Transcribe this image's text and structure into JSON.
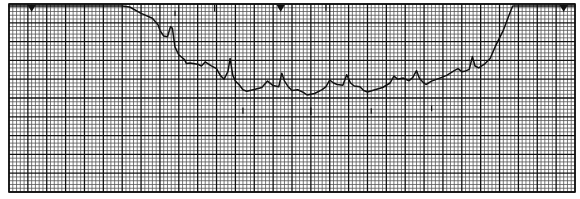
{
  "chart_data": {
    "type": "line",
    "title": "",
    "xlabel": "",
    "ylabel": "",
    "grid": true,
    "grid_major_every": 5,
    "x_range": [
      0,
      150
    ],
    "y_range": [
      0,
      50
    ],
    "colors": {
      "paper": "#ffffff",
      "grid_minor": "#555555",
      "grid_major": "#111111",
      "trace": "#111111"
    },
    "markers": [
      {
        "name": "start-marker",
        "x": 6
      },
      {
        "name": "center-marker",
        "x": 72
      },
      {
        "name": "end-marker",
        "x": 147
      }
    ],
    "series": [
      {
        "name": "trace",
        "points": [
          [
            0,
            49.5
          ],
          [
            30,
            49.5
          ],
          [
            32,
            49.2
          ],
          [
            35,
            47.5
          ],
          [
            38,
            46.2
          ],
          [
            39.5,
            44.5
          ],
          [
            40,
            43.0
          ],
          [
            41,
            41.5
          ],
          [
            42,
            41.3
          ],
          [
            42.8,
            44.0
          ],
          [
            43.3,
            43.5
          ],
          [
            44,
            38.5
          ],
          [
            45,
            36.5
          ],
          [
            46.5,
            35.2
          ],
          [
            47,
            34.2
          ],
          [
            48,
            34.3
          ],
          [
            50,
            34.0
          ],
          [
            51,
            33.5
          ],
          [
            52,
            34.6
          ],
          [
            53.5,
            33.6
          ],
          [
            55,
            32.8
          ],
          [
            56,
            31.0
          ],
          [
            57,
            30.0
          ],
          [
            58,
            32.0
          ],
          [
            58.6,
            35.5
          ],
          [
            59.3,
            31.0
          ],
          [
            60,
            29.5
          ],
          [
            61,
            28.5
          ],
          [
            62,
            27.2
          ],
          [
            63,
            26.8
          ],
          [
            65,
            27.3
          ],
          [
            67,
            27.8
          ],
          [
            68.5,
            29.5
          ],
          [
            70,
            28.3
          ],
          [
            71.5,
            28.0
          ],
          [
            72.3,
            31.6
          ],
          [
            73,
            29.5
          ],
          [
            74,
            28.0
          ],
          [
            75,
            27.0
          ],
          [
            76.5,
            27.2
          ],
          [
            78,
            26.5
          ],
          [
            79,
            25.8
          ],
          [
            81,
            26.2
          ],
          [
            83,
            27.2
          ],
          [
            84,
            28.0
          ],
          [
            85,
            29.8
          ],
          [
            86,
            29.0
          ],
          [
            87,
            28.6
          ],
          [
            88.5,
            28.4
          ],
          [
            89.5,
            31.2
          ],
          [
            90.5,
            29.0
          ],
          [
            91.5,
            28.2
          ],
          [
            93,
            28.0
          ],
          [
            94,
            27.0
          ],
          [
            95,
            26.6
          ],
          [
            97,
            27.2
          ],
          [
            99,
            27.8
          ],
          [
            101,
            29.0
          ],
          [
            102,
            30.8
          ],
          [
            103,
            30.0
          ],
          [
            104.5,
            30.3
          ],
          [
            106,
            29.6
          ],
          [
            107,
            30.4
          ],
          [
            108,
            32.3
          ],
          [
            108.8,
            30.2
          ],
          [
            109.6,
            29.3
          ],
          [
            110.5,
            28.6
          ],
          [
            112,
            29.5
          ],
          [
            114,
            30.2
          ],
          [
            116,
            31.0
          ],
          [
            118,
            32.3
          ],
          [
            119,
            32.8
          ],
          [
            120,
            32.0
          ],
          [
            121,
            32.2
          ],
          [
            122,
            32.6
          ],
          [
            122.8,
            36.0
          ],
          [
            123.5,
            33.5
          ],
          [
            124.5,
            33.0
          ],
          [
            126,
            34.0
          ],
          [
            127.5,
            35.5
          ],
          [
            129,
            39.0
          ],
          [
            131,
            43.0
          ],
          [
            132.5,
            47.0
          ],
          [
            133.5,
            49.5
          ],
          [
            150,
            49.5
          ]
        ]
      }
    ],
    "spikes_below": [
      {
        "x": 62,
        "y_top": 22.5,
        "y_bottom": 20.8
      },
      {
        "x": 80,
        "y_top": 22.5,
        "y_bottom": 20.5
      },
      {
        "x": 96,
        "y_top": 22.3,
        "y_bottom": 20.8
      },
      {
        "x": 112,
        "y_top": 23.0,
        "y_bottom": 21.5
      },
      {
        "x": 44,
        "y_top": 48.2,
        "y_bottom": 46.8
      },
      {
        "x": 54.5,
        "y_top": 49.8,
        "y_bottom": 48.0
      },
      {
        "x": 84,
        "y_top": 49.8,
        "y_bottom": 48.2
      }
    ]
  }
}
